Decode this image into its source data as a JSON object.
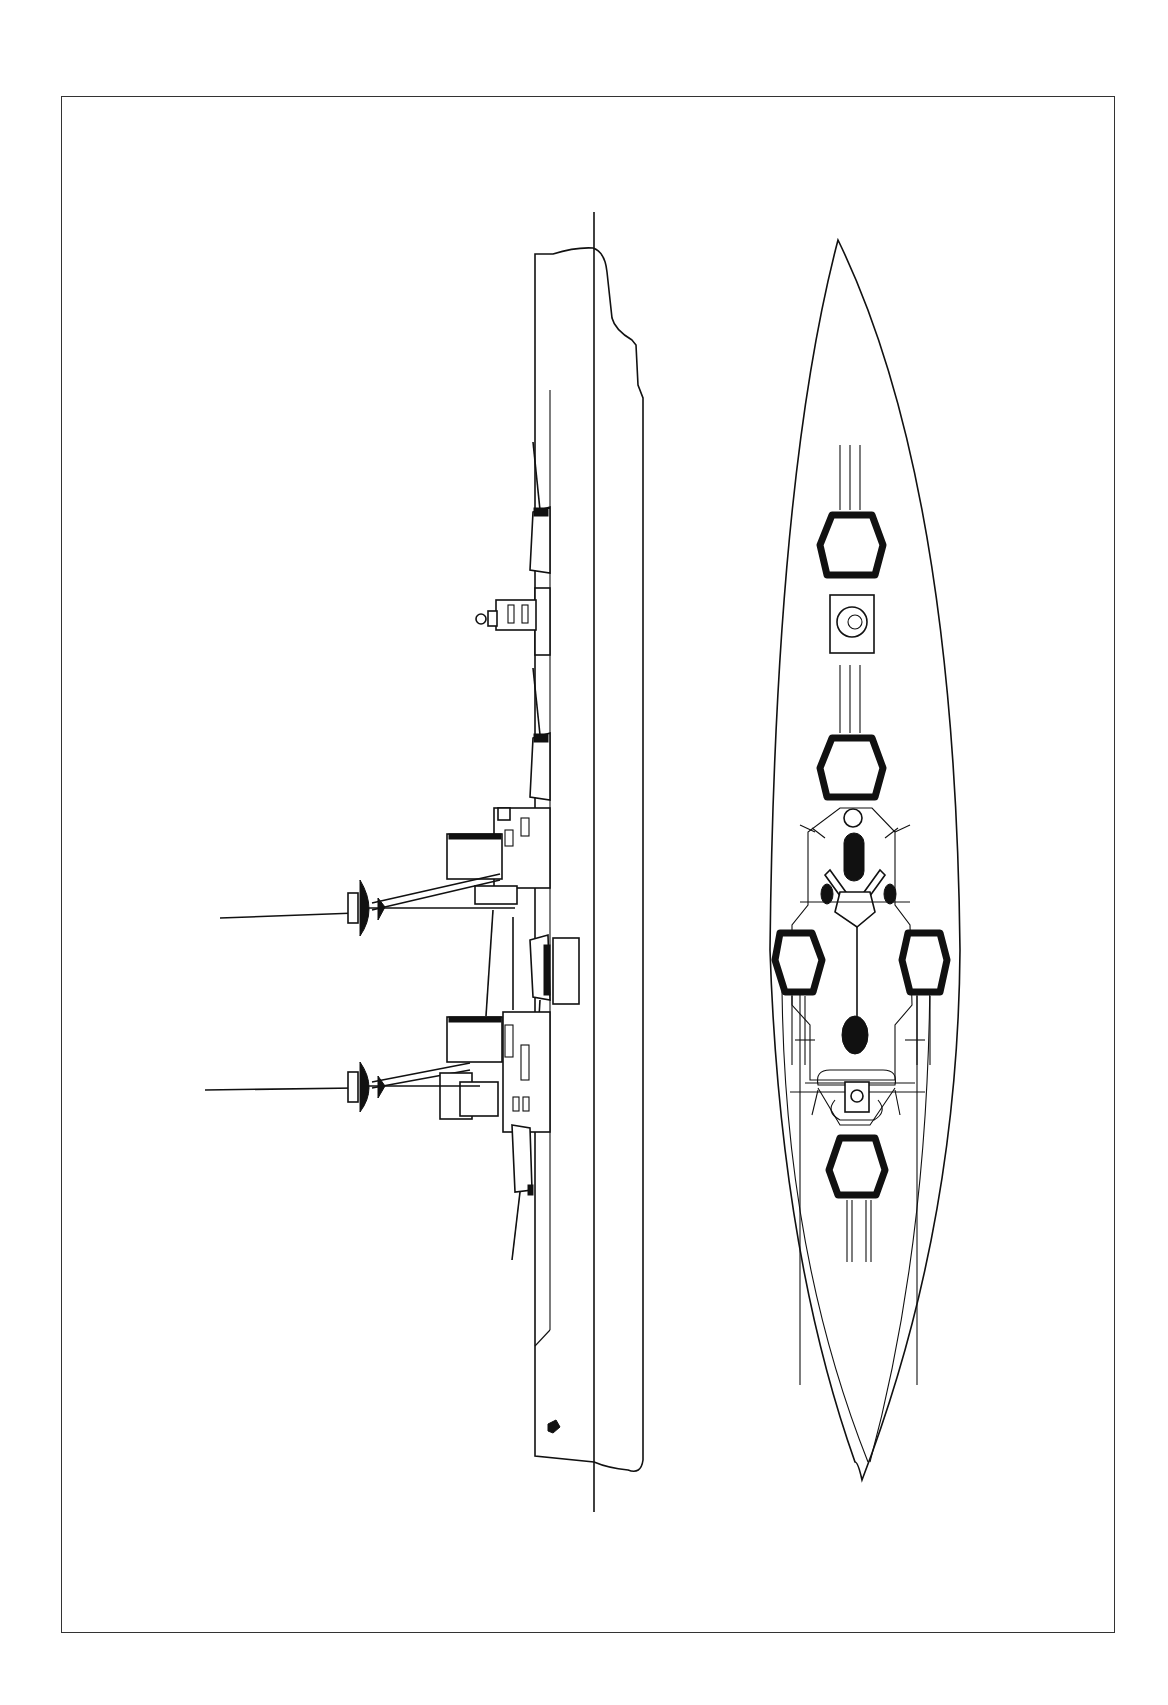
{
  "drawing": {
    "subject": "Battleship line drawing",
    "views": [
      {
        "name": "profile",
        "orientation": "rotated 90 degrees, bow at top"
      },
      {
        "name": "plan",
        "orientation": "rotated 90 degrees, bow at top"
      }
    ],
    "colors": {
      "line": "#111111",
      "background": "#ffffff",
      "frame": "#333333"
    },
    "plan_view": {
      "main_turrets": 6
    },
    "profile_view": {
      "masts": 2,
      "funnels": 2
    }
  }
}
